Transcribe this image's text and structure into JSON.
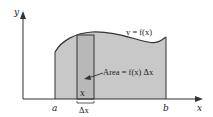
{
  "diagram": {
    "axes": {
      "x_label": "x",
      "y_label": "y"
    },
    "curve_label": "y = f(x)",
    "bounds": {
      "a": "a",
      "b": "b"
    },
    "strip": {
      "position_label": "x",
      "width_label": "Δx"
    },
    "annotation": "Area = f(x) Δx",
    "colors": {
      "fill": "#c8c8c8",
      "strip_fill": "#b8b8b8",
      "stroke": "#333333"
    }
  }
}
